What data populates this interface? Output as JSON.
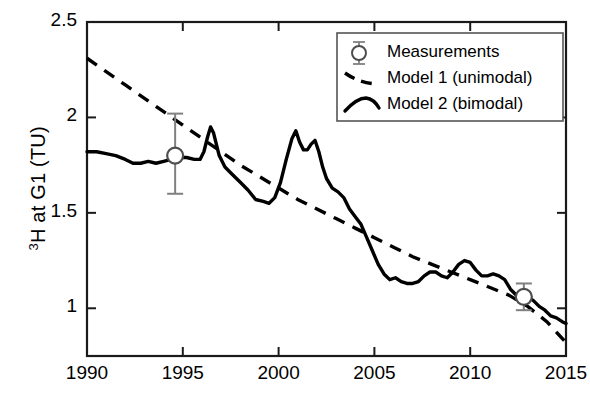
{
  "chart_data": {
    "type": "line",
    "title": "",
    "xlabel": "",
    "ylabel": "3H at G1 (TU)",
    "ylabel_prefix": "3",
    "ylabel_rest": "H at G1 (TU)",
    "xlim": [
      1990,
      2015
    ],
    "ylim": [
      0.75,
      2.5
    ],
    "grid": false,
    "xticks": [
      1990,
      1995,
      2000,
      2005,
      2010,
      2015
    ],
    "xtick_labels": [
      "1990",
      "1995",
      "2000",
      "2005",
      "2010",
      "2015"
    ],
    "yticks": [
      1,
      1.5,
      2,
      2.5
    ],
    "ytick_labels": [
      "1",
      "1.5",
      "2",
      "2.5"
    ],
    "legend_position": "top-right",
    "legend": [
      {
        "label": "Measurements",
        "marker": "circle-open-errorbar",
        "style": "marker"
      },
      {
        "label": "Model 1 (unimodal)",
        "marker": "dashed-line",
        "style": "dashed"
      },
      {
        "label": "Model 2 (bimodal)",
        "marker": "solid-line",
        "style": "solid"
      }
    ],
    "series": [
      {
        "name": "Measurements",
        "type": "scatter-errorbar",
        "points": [
          {
            "x": 1994.6,
            "y": 1.8,
            "yerr_low": 1.6,
            "yerr_high": 2.02
          },
          {
            "x": 2012.8,
            "y": 1.06,
            "yerr_low": 0.99,
            "yerr_high": 1.13
          }
        ]
      },
      {
        "name": "Model 1 (unimodal)",
        "type": "dashed",
        "x": [
          1990,
          1991,
          1992,
          1993,
          1994,
          1995,
          1996,
          1997,
          1998,
          1999,
          2000,
          2001,
          2002,
          2003,
          2004,
          2005,
          2006,
          2007,
          2008,
          2009,
          2010,
          2011,
          2012,
          2013,
          2014,
          2015
        ],
        "values": [
          2.31,
          2.24,
          2.17,
          2.1,
          2.03,
          1.96,
          1.89,
          1.82,
          1.75,
          1.69,
          1.63,
          1.57,
          1.52,
          1.47,
          1.42,
          1.37,
          1.32,
          1.27,
          1.23,
          1.19,
          1.15,
          1.11,
          1.07,
          1.01,
          0.93,
          0.82
        ]
      },
      {
        "name": "Model 2 (bimodal)",
        "type": "solid",
        "x": [
          1990.0,
          1990.5,
          1991.0,
          1991.5,
          1992.0,
          1992.4,
          1992.8,
          1993.2,
          1993.6,
          1994.0,
          1994.4,
          1994.8,
          1995.2,
          1995.6,
          1995.9,
          1996.1,
          1996.3,
          1996.45,
          1996.6,
          1996.9,
          1997.2,
          1997.6,
          1998.0,
          1998.4,
          1998.8,
          1999.2,
          1999.5,
          1999.8,
          2000.1,
          2000.4,
          2000.7,
          2000.9,
          2001.1,
          2001.3,
          2001.5,
          2001.7,
          2001.9,
          2002.1,
          2002.3,
          2002.5,
          2002.8,
          2003.1,
          2003.4,
          2003.7,
          2004.0,
          2004.3,
          2004.6,
          2004.9,
          2005.2,
          2005.5,
          2005.8,
          2006.1,
          2006.4,
          2006.7,
          2007.0,
          2007.3,
          2007.6,
          2007.9,
          2008.2,
          2008.5,
          2008.8,
          2009.1,
          2009.4,
          2009.7,
          2010.0,
          2010.3,
          2010.6,
          2010.9,
          2011.2,
          2011.5,
          2011.8,
          2012.1,
          2012.4,
          2012.7,
          2013.0,
          2013.3,
          2013.6,
          2013.9,
          2014.2,
          2014.5,
          2014.8,
          2015.0
        ],
        "values": [
          1.82,
          1.82,
          1.81,
          1.8,
          1.78,
          1.76,
          1.76,
          1.77,
          1.76,
          1.77,
          1.78,
          1.79,
          1.79,
          1.78,
          1.78,
          1.82,
          1.9,
          1.95,
          1.92,
          1.8,
          1.74,
          1.7,
          1.66,
          1.62,
          1.57,
          1.56,
          1.55,
          1.58,
          1.66,
          1.78,
          1.89,
          1.93,
          1.87,
          1.83,
          1.83,
          1.86,
          1.88,
          1.82,
          1.74,
          1.68,
          1.63,
          1.61,
          1.58,
          1.52,
          1.48,
          1.44,
          1.37,
          1.3,
          1.23,
          1.18,
          1.15,
          1.16,
          1.14,
          1.13,
          1.13,
          1.14,
          1.17,
          1.19,
          1.19,
          1.17,
          1.16,
          1.19,
          1.23,
          1.25,
          1.24,
          1.2,
          1.17,
          1.17,
          1.18,
          1.17,
          1.15,
          1.1,
          1.07,
          1.06,
          1.06,
          1.04,
          1.01,
          0.99,
          0.96,
          0.95,
          0.93,
          0.92
        ]
      }
    ]
  },
  "colors": {
    "axis": "#1a1a1a",
    "curve": "#000000",
    "dashed": "#000000",
    "marker_edge": "#4d4d4d",
    "errorbar": "#808080",
    "legend_border": "#555555",
    "background": "#ffffff"
  },
  "axes": {
    "y_title": "H at G1 (TU)",
    "y_title_sup": "3"
  }
}
